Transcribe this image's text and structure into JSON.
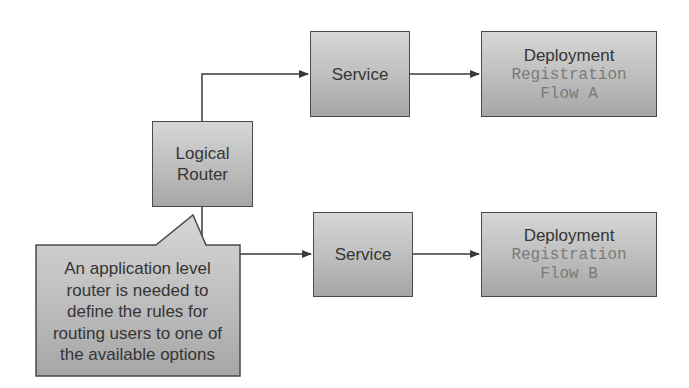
{
  "diagram": {
    "router": {
      "line1": "Logical",
      "line2": "Router"
    },
    "services": [
      {
        "label": "Service"
      },
      {
        "label": "Service"
      }
    ],
    "deployments": [
      {
        "title": "Deployment",
        "name_line1": "Registration",
        "name_line2": "Flow A"
      },
      {
        "title": "Deployment",
        "name_line1": "Registration",
        "name_line2": "Flow B"
      }
    ],
    "callout": {
      "lines": [
        "An application level",
        "router is needed to",
        "define the rules for",
        "routing users to one of",
        "the available options"
      ]
    },
    "colors": {
      "box_border": "#4a4a4a",
      "box_fill_top": "#d6d6d6",
      "box_fill_bottom": "#a6a6a6",
      "mono_text": "#7a7a7a",
      "line": "#3a3a3a"
    }
  }
}
